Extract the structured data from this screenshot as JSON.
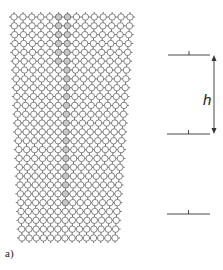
{
  "figure": {
    "panel_label": "a)",
    "height_label": "h"
  },
  "lattice": {
    "cols": 14,
    "rows": 26,
    "top_left_x": 14,
    "top_right_x": 130,
    "bottom_left_x": 22,
    "bottom_right_x": 115,
    "top_y": 17,
    "bottom_y": 238,
    "node_radius": 3.2,
    "shaded_col": 6,
    "colors": {
      "line": "#555555",
      "node_fill": "#ffffff",
      "shaded_fill": "#c8c8c8"
    }
  },
  "markers": [
    {
      "y": 55,
      "x1": 168,
      "x2": 210
    },
    {
      "y": 134,
      "x1": 167,
      "x2": 210
    },
    {
      "y": 214,
      "x1": 167,
      "x2": 210
    }
  ],
  "arrow": {
    "x": 214,
    "y1": 55,
    "y2": 134
  }
}
